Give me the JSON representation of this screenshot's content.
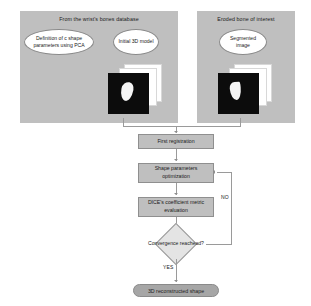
{
  "diagram": {
    "colors": {
      "panel_fill": "#bfbfbf",
      "box_fill": "#bfbfbf",
      "diamond_fill": "#e4e4e4",
      "pill_fill": "#a6a6a6",
      "ellipse_fill": "#ffffff",
      "connector": "#9a9a9a",
      "slice_dark": "#0c0c0c",
      "bone_white": "#f4f4f4",
      "background": "#ffffff"
    },
    "panels": [
      {
        "id": "database-panel",
        "title": "From the wrist's bones database",
        "callouts": [
          {
            "id": "pca-definition",
            "label": "Definition of c shape parameters using PCA"
          },
          {
            "id": "initial-3d-model",
            "label": "Initial 3D model"
          }
        ],
        "image_stack": {
          "name": "initial-model-slice-stack",
          "slice_count": 3
        }
      },
      {
        "id": "eroded-bone-panel",
        "title": "Eroded bone of interest",
        "callouts": [
          {
            "id": "segmented-image",
            "label": "Segmented image"
          }
        ],
        "image_stack": {
          "name": "segmented-slice-stack",
          "slice_count": 3
        }
      }
    ],
    "process_steps": [
      {
        "id": "first-registration",
        "label": "First registration"
      },
      {
        "id": "shape-parameters-optimization",
        "label": "Shape parameters optimization"
      },
      {
        "id": "dice-metric-evaluation",
        "label": "DICE's coefficient metric evaluation"
      }
    ],
    "decision": {
      "id": "convergence-decision",
      "label": "Convergence reachead?",
      "branch_no_label": "NO",
      "branch_yes_label": "YES"
    },
    "terminator": {
      "id": "reconstructed-shape",
      "label": "3D reconstructed shape"
    }
  }
}
